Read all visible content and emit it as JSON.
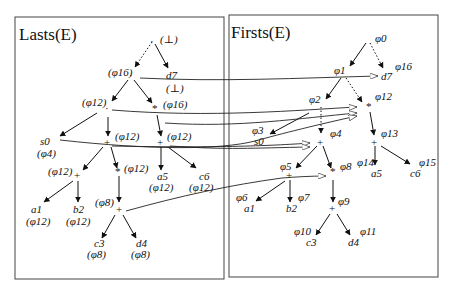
{
  "panels": {
    "left": {
      "title": "Lasts(E)"
    },
    "right": {
      "title": "Firsts(E)"
    }
  },
  "left_tree": {
    "nodes": [
      {
        "id": "root",
        "sym": "·",
        "ann": "(⊥)"
      },
      {
        "id": "n16",
        "sym": "·",
        "ann": "(φ16)"
      },
      {
        "id": "d7",
        "sym": "d7",
        "ann": "(⊥)"
      },
      {
        "id": "n12",
        "sym": "·",
        "ann": "(φ12)"
      },
      {
        "id": "star",
        "sym": "*",
        "ann": "(φ16)"
      },
      {
        "id": "s0",
        "sym": "s0",
        "ann": "(φ4)"
      },
      {
        "id": "plusA",
        "sym": "+",
        "ann": "(φ12)"
      },
      {
        "id": "plusB",
        "sym": "+",
        "ann": "(φ12)"
      },
      {
        "id": "plusC",
        "sym": "+",
        "ann": "(φ12)"
      },
      {
        "id": "dotD",
        "sym": "·",
        "ann": "(φ12)"
      },
      {
        "id": "a5",
        "sym": "a5",
        "ann": "(φ12)"
      },
      {
        "id": "c6",
        "sym": "c6",
        "ann": "(φ12)"
      },
      {
        "id": "a1",
        "sym": "a1",
        "ann": "(φ12)"
      },
      {
        "id": "b2",
        "sym": "b2",
        "ann": "(φ12)"
      },
      {
        "id": "plusE",
        "sym": "+",
        "ann": "(φ8)"
      },
      {
        "id": "c3",
        "sym": "c3",
        "ann": "(φ8)"
      },
      {
        "id": "d4",
        "sym": "d4",
        "ann": "(φ8)"
      }
    ]
  },
  "right_tree": {
    "nodes": [
      {
        "id": "root",
        "ann": "φ0"
      },
      {
        "id": "p1",
        "ann": "φ1"
      },
      {
        "id": "d7",
        "sym": "d7",
        "ann": "φ16"
      },
      {
        "id": "p2",
        "ann": "φ2"
      },
      {
        "id": "p12",
        "ann": "φ12"
      },
      {
        "id": "s0",
        "sym": "s0",
        "ann": "φ3"
      },
      {
        "id": "p4",
        "ann": "φ4"
      },
      {
        "id": "p13",
        "ann": "φ13"
      },
      {
        "id": "p5",
        "ann": "φ5"
      },
      {
        "id": "p8",
        "ann": "φ8"
      },
      {
        "id": "a5",
        "sym": "a5",
        "ann": "φ14"
      },
      {
        "id": "c6",
        "sym": "c6",
        "ann": "φ15"
      },
      {
        "id": "a1",
        "sym": "a1",
        "ann": "φ6"
      },
      {
        "id": "b2",
        "sym": "b2",
        "ann": "φ7"
      },
      {
        "id": "p9",
        "ann": "φ9"
      },
      {
        "id": "c3",
        "sym": "c3",
        "ann": "φ10"
      },
      {
        "id": "d4",
        "sym": "d4",
        "ann": "φ11"
      }
    ]
  },
  "labels": {
    "L_root": "(⊥)",
    "L_n16": "(φ16)",
    "L_d7": "d7",
    "L_d7a": "(⊥)",
    "L_n12": "(φ12)",
    "L_star": "(φ16)",
    "L_s0": "s0",
    "L_s0a": "(φ4)",
    "L_pA": "(φ12)",
    "L_pB": "(φ12)",
    "L_pC": "(φ12)",
    "L_dD": "(φ12)",
    "L_a5": "a5",
    "L_a5a": "(φ12)",
    "L_c6": "c6",
    "L_c6a": "(φ12)",
    "L_a1": "a1",
    "L_a1a": "(φ12)",
    "L_b2": "b2",
    "L_b2a": "(φ12)",
    "L_pE": "(φ8)",
    "L_c3": "c3",
    "L_c3a": "(φ8)",
    "L_d4": "d4",
    "L_d4a": "(φ8)",
    "R_root": "φ0",
    "R_p1": "φ1",
    "R_d7": "d7",
    "R_d7a": "φ16",
    "R_p2": "φ2",
    "R_p12": "φ12",
    "R_s0": "s0",
    "R_s0a": "φ3",
    "R_p4": "φ4",
    "R_p13": "φ13",
    "R_p5": "φ5",
    "R_p8": "φ8",
    "R_a5": "a5",
    "R_a5a": "φ14",
    "R_c6": "c6",
    "R_c6a": "φ15",
    "R_a1": "a1",
    "R_a1a": "φ6",
    "R_b2": "b2",
    "R_b2a": "φ7",
    "R_p9": "φ9",
    "R_c3": "c3",
    "R_c3a": "φ10",
    "R_d4": "d4",
    "R_d4a": "φ11",
    "plus": "+",
    "star": "*",
    "dot": "·"
  }
}
